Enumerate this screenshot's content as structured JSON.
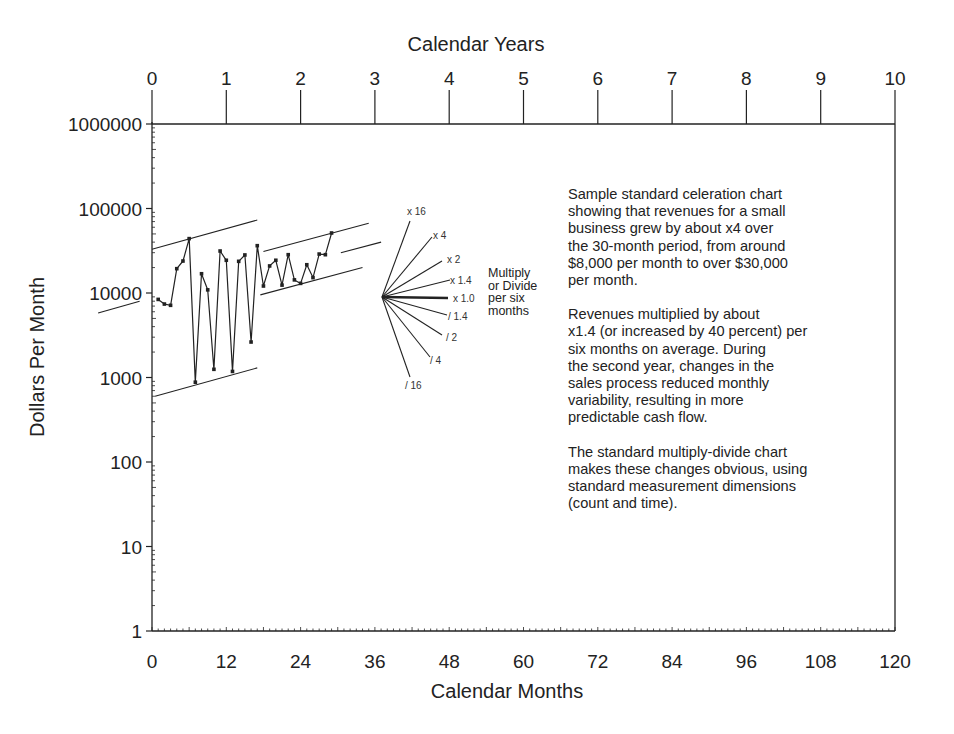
{
  "chart_data": {
    "type": "line",
    "subtype": "standard celeration chart (semi-log)",
    "title": "",
    "xlabel": "Calendar Months",
    "x2label": "Calendar Years",
    "ylabel": "Dollars Per Month",
    "yscale": "log",
    "ylim": [
      1,
      1000000
    ],
    "xlim": [
      0,
      120
    ],
    "x_ticks": [
      0,
      12,
      24,
      36,
      48,
      60,
      72,
      84,
      96,
      108,
      120
    ],
    "x2_ticks": [
      0,
      1,
      2,
      3,
      4,
      5,
      6,
      7,
      8,
      9,
      10
    ],
    "y_ticks": [
      1,
      10,
      100,
      1000,
      10000,
      100000,
      1000000
    ],
    "y_tick_labels": [
      "1",
      "10",
      "100",
      "1000",
      "10000",
      "100000",
      "1000000"
    ],
    "grid": false,
    "series": [
      {
        "name": "Monthly revenue",
        "x": [
          1,
          2,
          3,
          4,
          5,
          6,
          7,
          8,
          9,
          10,
          11,
          12,
          13,
          14,
          15,
          16,
          17,
          18,
          19,
          20,
          21,
          22,
          23,
          24,
          25,
          26,
          27,
          28,
          29
        ],
        "values": [
          8400,
          7400,
          7150,
          19400,
          23900,
          44000,
          880,
          16900,
          10900,
          1250,
          31400,
          24400,
          1180,
          23700,
          28200,
          2630,
          36300,
          12100,
          20900,
          24400,
          12400,
          28400,
          14300,
          13000,
          21600,
          15200,
          28900,
          28400,
          51300
        ]
      }
    ],
    "trend_lines": [
      {
        "name": "upper-bounce-year1",
        "x": [
          0,
          17
        ],
        "values": [
          33000,
          73000
        ]
      },
      {
        "name": "lower-bounce-year1",
        "x": [
          0.5,
          17
        ],
        "values": [
          600,
          1300
        ]
      },
      {
        "name": "upper-bounce-year2",
        "x": [
          18,
          35
        ],
        "values": [
          31000,
          67000
        ]
      },
      {
        "name": "lower-bounce-year2",
        "x": [
          17.5,
          34
        ],
        "values": [
          9500,
          20000
        ]
      },
      {
        "name": "celeration-projection",
        "x": [
          30.5,
          37
        ],
        "values": [
          30000,
          40000
        ]
      },
      {
        "name": "celeration-left-stub",
        "x": [
          -8.7,
          -2
        ],
        "values": [
          5800,
          8000
        ]
      }
    ],
    "fan": {
      "caption": [
        "Multiply",
        "or Divide",
        "per six",
        "months"
      ],
      "rays": [
        {
          "label": "x 16"
        },
        {
          "label": "x 4"
        },
        {
          "label": "x 2"
        },
        {
          "label": "x 1.4"
        },
        {
          "label": "x 1.0"
        },
        {
          "label": "/ 1.4"
        },
        {
          "label": "/ 2"
        },
        {
          "label": "/ 4"
        },
        {
          "label": "/ 16"
        }
      ]
    },
    "annotations": [
      "Sample standard celeration chart showing that revenues for a small business grew by about x4 over the 30-month period, from around $8,000 per month to over $30,000 per month.",
      "Revenues multiplied by about x1.4 (or increased by 40 percent) per six months on average. During the second year, changes in the sales process reduced monthly variability, resulting in more predictable cash flow.",
      "The standard multiply-divide chart makes these changes obvious, using standard measurement dimensions (count and time)."
    ]
  },
  "notes": {
    "p1": "Sample standard celeration chart\nshowing that revenues for a small\nbusiness grew by about x4 over\nthe 30-month period, from around\n$8,000 per month to over $30,000\nper month.",
    "p2": "Revenues multiplied by about\nx1.4 (or increased by 40 percent) per\nsix months on average. During\nthe second year, changes in the\nsales process reduced monthly\nvariability, resulting in more\npredictable cash flow.",
    "p3": "The standard multiply-divide chart\nmakes these changes obvious, using\nstandard measurement dimensions\n(count and time)."
  },
  "colors": {
    "ink": "#222222",
    "background": "#ffffff"
  }
}
